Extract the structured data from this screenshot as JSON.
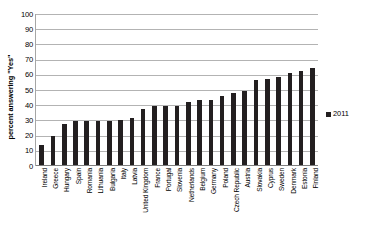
{
  "chart_data": {
    "type": "bar",
    "title": "",
    "xlabel": "",
    "ylabel": "percent answering \"Yes\"",
    "ylim": [
      0,
      100
    ],
    "ytick_step": 10,
    "yticks": [
      100,
      90,
      80,
      70,
      60,
      50,
      40,
      30,
      20,
      10,
      0
    ],
    "grid": true,
    "legend_position": "right",
    "bar_color": "#231f20",
    "gridline_color": "#b3b3b3",
    "categories": [
      "Ireland",
      "Greece",
      "Hungary",
      "Spain",
      "Romania",
      "Lithuania",
      "Bulgaria",
      "Italy",
      "Latvia",
      "United Kingdom",
      "France",
      "Portugal",
      "Slovenia",
      "Netherlands",
      "Belgium",
      "Germany",
      "Poland",
      "Czech Republic",
      "Austria",
      "Slovakia",
      "Cyprus",
      "Sweden",
      "Denmark",
      "Estonia",
      "Finland"
    ],
    "series": [
      {
        "name": "2011",
        "values": [
          13,
          19,
          27,
          29,
          29,
          29,
          29,
          30,
          31,
          37,
          39,
          39,
          39,
          42,
          43,
          43,
          46,
          48,
          49,
          56,
          57,
          58,
          61,
          62,
          64
        ]
      }
    ]
  },
  "legend": {
    "entries": [
      {
        "label": "2011",
        "color": "#231f20"
      }
    ]
  }
}
